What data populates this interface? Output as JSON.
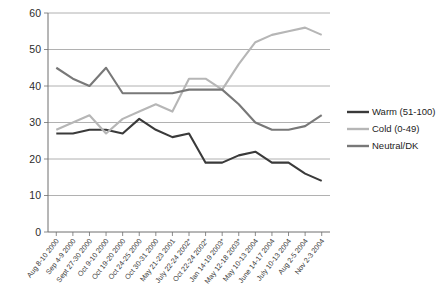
{
  "chart_data": {
    "type": "line",
    "title": "",
    "xlabel": "",
    "ylabel": "",
    "ylim": [
      0,
      60
    ],
    "yticks": [
      0,
      10,
      20,
      30,
      40,
      50,
      60
    ],
    "grid": true,
    "legend_position": "right",
    "categories": [
      "Aug 8-10 2000",
      "Sep 4-9 2000",
      "Sept 27-30 2000",
      "Oct 9-10 2000",
      "Oct 19-20 2000",
      "Oct 24-25 2000",
      "Oct 30-31 2000",
      "May 21-23 2001",
      "July 22-24 2002*",
      "Oct 22-24 2002*",
      "Jan 14-19 2003*",
      "May 12-18 2003*",
      "May 10-13 2004",
      "June 14-17 2004",
      "July 10-13 2004",
      "Aug 2-5 2004",
      "Nov 2-3 2004"
    ],
    "series": [
      {
        "name": "Warm (51-100)",
        "color": "#3a3a3a",
        "values": [
          27,
          27,
          28,
          28,
          27,
          31,
          28,
          26,
          27,
          19,
          19,
          21,
          22,
          19,
          19,
          16,
          14
        ]
      },
      {
        "name": "Cold (0-49)",
        "color": "#b6b6b6",
        "values": [
          28,
          30,
          32,
          27,
          31,
          33,
          35,
          33,
          42,
          42,
          39,
          46,
          52,
          54,
          55,
          56,
          54
        ]
      },
      {
        "name": "Neutral/DK",
        "color": "#787878",
        "values": [
          45,
          42,
          40,
          45,
          38,
          38,
          38,
          38,
          39,
          39,
          39,
          35,
          30,
          28,
          28,
          29,
          32
        ]
      }
    ]
  },
  "legend": {
    "entries": [
      {
        "label": "Warm (51-100)"
      },
      {
        "label": "Cold (0-49)"
      },
      {
        "label": "Neutral/DK"
      }
    ]
  },
  "axis": {
    "y_labels": [
      "60",
      "50",
      "40",
      "30",
      "20",
      "10",
      "0"
    ]
  }
}
